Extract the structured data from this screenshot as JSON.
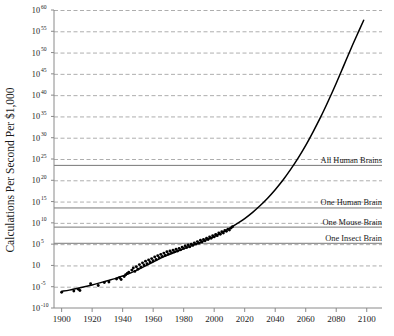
{
  "chart_data": {
    "type": "scatter",
    "title": "",
    "subtitle": "",
    "xlabel": "",
    "ylabel": "Calculations Per Second Per $1,000",
    "xlim": [
      1895,
      2110
    ],
    "ylim": [
      -10,
      60
    ],
    "y_scale": "log10",
    "y_tick_base": "10",
    "grid": true,
    "grid_style": "dashed",
    "legend": "none",
    "xticks": [
      1900,
      1920,
      1940,
      1960,
      1980,
      2000,
      2020,
      2040,
      2060,
      2080,
      2100
    ],
    "xtick_labels": [
      "1900",
      "1920",
      "1940",
      "1960",
      "1980",
      "2000",
      "2020",
      "2040",
      "2060",
      "2080",
      "2100"
    ],
    "yticks": [
      -10,
      -5,
      0,
      5,
      10,
      15,
      20,
      25,
      30,
      35,
      40,
      45,
      50,
      55,
      60
    ],
    "ytick_labels": [
      "10-10",
      "10-5",
      "10",
      "105",
      "1010",
      "1015",
      "1020",
      "1025",
      "1030",
      "1035",
      "1040",
      "1045",
      "1050",
      "1055",
      "1060"
    ],
    "ytick_exponents": [
      "-10",
      "-5",
      "",
      "5",
      "10",
      "15",
      "20",
      "25",
      "30",
      "35",
      "40",
      "45",
      "50",
      "55",
      "60"
    ],
    "reference_lines": [
      {
        "label": "All Human Brains",
        "y": 23.5
      },
      {
        "label": "One Human Brain",
        "y": 13.5
      },
      {
        "label": "One Mouse Brain",
        "y": 9.0
      },
      {
        "label": "One Insect Brain",
        "y": 5.2
      }
    ],
    "series": [
      {
        "name": "Trend Curve",
        "type": "line",
        "color": "#000000",
        "points": [
          [
            1900,
            -6.1
          ],
          [
            1905,
            -5.8
          ],
          [
            1910,
            -5.4
          ],
          [
            1915,
            -5.0
          ],
          [
            1920,
            -4.6
          ],
          [
            1925,
            -4.1
          ],
          [
            1930,
            -3.6
          ],
          [
            1935,
            -3.1
          ],
          [
            1940,
            -2.5
          ],
          [
            1945,
            -1.8
          ],
          [
            1950,
            -1.0
          ],
          [
            1955,
            -0.1
          ],
          [
            1960,
            0.8
          ],
          [
            1965,
            1.7
          ],
          [
            1970,
            2.5
          ],
          [
            1975,
            3.2
          ],
          [
            1980,
            3.9
          ],
          [
            1985,
            4.6
          ],
          [
            1990,
            5.3
          ],
          [
            1995,
            6.0
          ],
          [
            2000,
            6.8
          ],
          [
            2005,
            7.7
          ],
          [
            2010,
            8.7
          ],
          [
            2015,
            9.8
          ],
          [
            2020,
            11.0
          ],
          [
            2025,
            12.4
          ],
          [
            2030,
            14.0
          ],
          [
            2035,
            15.8
          ],
          [
            2040,
            17.8
          ],
          [
            2045,
            20.0
          ],
          [
            2050,
            22.5
          ],
          [
            2055,
            25.2
          ],
          [
            2060,
            28.2
          ],
          [
            2065,
            31.5
          ],
          [
            2070,
            35.0
          ],
          [
            2075,
            38.8
          ],
          [
            2080,
            42.8
          ],
          [
            2085,
            47.0
          ],
          [
            2090,
            51.2
          ],
          [
            2095,
            55.2
          ],
          [
            2098,
            57.6
          ]
        ]
      },
      {
        "name": "Computing Devices",
        "type": "scatter",
        "color": "#000000",
        "marker": "circle",
        "points": [
          [
            1900,
            -6.3
          ],
          [
            1908,
            -6.0
          ],
          [
            1911,
            -5.6
          ],
          [
            1912,
            -5.9
          ],
          [
            1919,
            -4.3
          ],
          [
            1924,
            -4.7
          ],
          [
            1928,
            -4.0
          ],
          [
            1931,
            -3.9
          ],
          [
            1936,
            -3.2
          ],
          [
            1938,
            -2.9
          ],
          [
            1939,
            -3.3
          ],
          [
            1941,
            -2.6
          ],
          [
            1942,
            -2.2
          ],
          [
            1943,
            -1.9
          ],
          [
            1944,
            -1.6
          ],
          [
            1946,
            -1.1
          ],
          [
            1947,
            -0.6
          ],
          [
            1948,
            -1.4
          ],
          [
            1949,
            -0.3
          ],
          [
            1950,
            -0.9
          ],
          [
            1951,
            0.2
          ],
          [
            1952,
            -0.4
          ],
          [
            1953,
            0.6
          ],
          [
            1954,
            0.1
          ],
          [
            1955,
            1.0
          ],
          [
            1956,
            0.4
          ],
          [
            1957,
            1.3
          ],
          [
            1958,
            0.8
          ],
          [
            1959,
            1.6
          ],
          [
            1960,
            1.1
          ],
          [
            1961,
            2.0
          ],
          [
            1962,
            1.4
          ],
          [
            1963,
            2.3
          ],
          [
            1964,
            1.8
          ],
          [
            1965,
            2.6
          ],
          [
            1966,
            2.1
          ],
          [
            1967,
            2.9
          ],
          [
            1968,
            2.4
          ],
          [
            1969,
            3.2
          ],
          [
            1970,
            2.7
          ],
          [
            1971,
            3.4
          ],
          [
            1972,
            3.0
          ],
          [
            1973,
            3.6
          ],
          [
            1974,
            3.2
          ],
          [
            1975,
            3.8
          ],
          [
            1976,
            3.4
          ],
          [
            1977,
            4.0
          ],
          [
            1978,
            3.7
          ],
          [
            1979,
            4.3
          ],
          [
            1980,
            4.0
          ],
          [
            1981,
            4.6
          ],
          [
            1982,
            4.2
          ],
          [
            1983,
            4.8
          ],
          [
            1984,
            4.4
          ],
          [
            1985,
            5.0
          ],
          [
            1986,
            4.7
          ],
          [
            1987,
            5.3
          ],
          [
            1988,
            5.0
          ],
          [
            1989,
            5.6
          ],
          [
            1990,
            5.2
          ],
          [
            1991,
            5.9
          ],
          [
            1992,
            5.5
          ],
          [
            1993,
            6.1
          ],
          [
            1994,
            5.8
          ],
          [
            1995,
            6.4
          ],
          [
            1996,
            6.1
          ],
          [
            1997,
            6.7
          ],
          [
            1998,
            6.4
          ],
          [
            1999,
            7.0
          ],
          [
            2000,
            6.7
          ],
          [
            2001,
            7.3
          ],
          [
            2002,
            7.0
          ],
          [
            2003,
            7.6
          ],
          [
            2004,
            7.3
          ],
          [
            2005,
            7.9
          ],
          [
            2006,
            7.6
          ],
          [
            2007,
            8.2
          ],
          [
            2008,
            8.0
          ],
          [
            2009,
            8.5
          ],
          [
            2010,
            8.3
          ],
          [
            2011,
            8.8
          ],
          [
            2012,
            9.1
          ]
        ]
      }
    ]
  }
}
